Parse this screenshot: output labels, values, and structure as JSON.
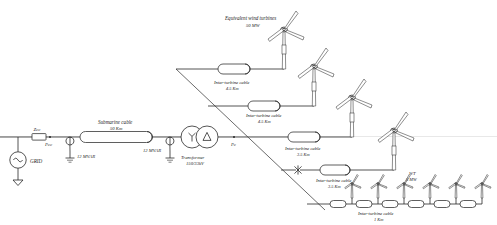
{
  "diagram": {
    "type": "single-line-electrical-schematic"
  },
  "grid": {
    "source_label": "GRID",
    "impedance_label": "Zcc",
    "node_label": "Pcc"
  },
  "reactors": [
    {
      "label": "12 MVAR"
    },
    {
      "label": "12 MVAR"
    }
  ],
  "submarine_cable": {
    "name": "Submarine cable",
    "length": "50 Km"
  },
  "transformer": {
    "name": "Transformer",
    "ratio": "150/33kV",
    "primary_winding": "Y",
    "secondary_winding": "Δ"
  },
  "collector_node": {
    "label": "Pc"
  },
  "equivalent_turbines": {
    "name": "Equivalent wind turbines",
    "rating": "50 MW"
  },
  "feeders": [
    {
      "cable_name": "Inter-turbine cable",
      "length": "4.5 Km"
    },
    {
      "cable_name": "Inter-turbine cable",
      "length": "4.5 Km"
    },
    {
      "cable_name": "Inter-turbine cable",
      "length": "3.5 Km"
    },
    {
      "cable_name": "Inter-turbine cable",
      "length": "3.5 Km"
    }
  ],
  "string_feeder": {
    "cable_name": "Inter-turbine cable",
    "length": "1 Km",
    "turbine_label": "WT",
    "turbine_rating": "5 MW",
    "turbine_count": 6
  },
  "colors": {
    "line": "#2a2a2a",
    "background": "#ffffff",
    "sea_line": "#d8d8d8"
  }
}
